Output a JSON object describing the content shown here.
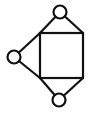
{
  "diagram": {
    "type": "graph",
    "colors": {
      "stroke": "#111111",
      "fill": "#ffffff",
      "background": "#ffffff"
    },
    "square": {
      "x": 40,
      "y": 33,
      "width": 43,
      "height": 45
    },
    "nodes": [
      {
        "id": "top",
        "cx": 60,
        "cy": 12,
        "r": 6.5
      },
      {
        "id": "left",
        "cx": 14,
        "cy": 57,
        "r": 6.5
      },
      {
        "id": "bottom",
        "cx": 59,
        "cy": 100,
        "r": 6.5
      }
    ],
    "edges": [
      {
        "from": "top",
        "to": "square-top-left",
        "x1": 60,
        "y1": 12,
        "x2": 40,
        "y2": 33
      },
      {
        "from": "top",
        "to": "square-top-right",
        "x1": 60,
        "y1": 12,
        "x2": 83,
        "y2": 33
      },
      {
        "from": "left",
        "to": "square-top-left",
        "x1": 14,
        "y1": 57,
        "x2": 40,
        "y2": 33
      },
      {
        "from": "left",
        "to": "square-bottom-left",
        "x1": 14,
        "y1": 57,
        "x2": 40,
        "y2": 78
      },
      {
        "from": "bottom",
        "to": "square-bottom-left",
        "x1": 59,
        "y1": 100,
        "x2": 40,
        "y2": 78
      },
      {
        "from": "bottom",
        "to": "square-bottom-right",
        "x1": 59,
        "y1": 100,
        "x2": 83,
        "y2": 78
      }
    ]
  }
}
